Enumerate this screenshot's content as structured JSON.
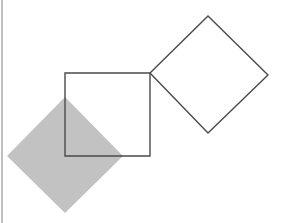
{
  "canvas": {
    "width": 283,
    "height": 223,
    "background_color": "#ffffff",
    "title": "Geometric Shapes Figure"
  },
  "colors": {
    "background": "#ffffff",
    "shape_fill_gray": "#c2c2c2",
    "outline_stroke": "#4a4a4a",
    "edge_strip": "#bfbfbf"
  },
  "shapes": {
    "edge_strip": {
      "label": "left-edge-strip",
      "x": 1,
      "y": 0,
      "width": 2,
      "height": 223,
      "color": "#bfbfbf"
    },
    "gray_diamond": {
      "label": "gray-filled-diamond",
      "fill": "#c2c2c2",
      "stroke": "none",
      "center_x": 65,
      "center_y": 156,
      "half_diagonal": 58,
      "points": "65,97 123,156 65,213 7,156"
    },
    "outlined_square": {
      "label": "outlined-square",
      "fill": "none",
      "stroke": "#4a4a4a",
      "stroke_width": 1.4,
      "x": 65,
      "y": 73,
      "width": 85,
      "height": 83,
      "points": "65,73 150,73 150,156 65,156"
    },
    "outlined_diamond": {
      "label": "outlined-diamond",
      "fill": "none",
      "stroke": "#4a4a4a",
      "stroke_width": 1.4,
      "center_x": 209,
      "center_y": 74,
      "points": "208,16 268,75 208,133 150,73"
    }
  }
}
